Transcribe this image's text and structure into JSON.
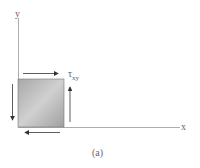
{
  "figure": {
    "x_axis_label": "x",
    "y_axis_label": "y",
    "stress_label": "τ",
    "stress_subscript": "xy",
    "caption": "(a)"
  },
  "colors": {
    "axis": "#888888",
    "arrow": "#333333",
    "element_fill_light": "#d6d6d6",
    "element_fill_dark": "#9a9a9a"
  }
}
